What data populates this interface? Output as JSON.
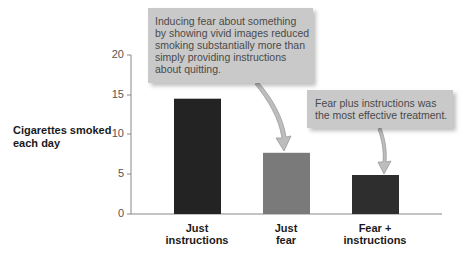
{
  "chart_data": {
    "type": "bar",
    "title": "",
    "xlabel": "",
    "ylabel": "Cigarettes smoked each day",
    "ylabel_lines": [
      "Cigarettes smoked",
      "each day"
    ],
    "categories": [
      "Just instructions",
      "Just fear",
      "Fear + instructions"
    ],
    "category_lines": [
      [
        "Just",
        "instructions"
      ],
      [
        "Just",
        "fear"
      ],
      [
        "Fear +",
        "instructions"
      ]
    ],
    "values": [
      14.5,
      7.7,
      4.9
    ],
    "bar_colors": [
      "#232323",
      "#7a7a7a",
      "#2e2e2e"
    ],
    "ylim": [
      0,
      20
    ],
    "yticks": [
      0,
      5,
      10,
      15,
      20
    ],
    "grid": false,
    "legend": null,
    "annotations": [
      {
        "text": "Inducing fear about something by showing vivid images reduced smoking substantially more than simply providing instructions about quitting.",
        "lines": [
          "Inducing fear about something",
          "by showing vivid images reduced",
          "smoking substantially more than",
          "simply providing instructions",
          "about quitting."
        ],
        "points_to": "Just fear"
      },
      {
        "text": "Fear plus instructions was the most effective treatment.",
        "lines": [
          "Fear plus instructions was",
          "the most effective treatment."
        ],
        "points_to": "Fear + instructions"
      }
    ]
  },
  "colors": {
    "axis": "#888888",
    "callout_bg": "#c9c9c9",
    "callout_text": "#4a4a4a",
    "arrow_fill": "#bdbdbd",
    "arrow_stroke": "#9a9a9a"
  }
}
